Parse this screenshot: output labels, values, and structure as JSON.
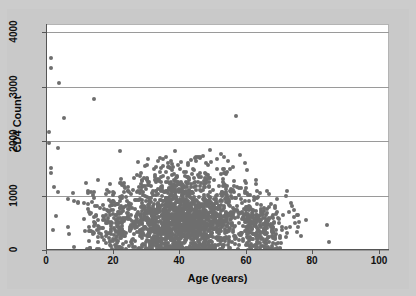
{
  "figure": {
    "background_color": "#c9c9c9",
    "plot_background_color": "#ffffff",
    "point_color": "#6e6e6e",
    "gridline_color": "#9a9a9a",
    "axis_color": "#555555"
  },
  "axes": {
    "x_title": "Age (years)",
    "y_title": "CD4 Count",
    "x_ticks": [
      "0",
      "20",
      "40",
      "60",
      "80",
      "100"
    ],
    "y_ticks": [
      "0",
      "1000",
      "2000",
      "3000",
      "4000"
    ]
  },
  "chart_data": {
    "type": "scatter",
    "title": "",
    "xlabel": "Age (years)",
    "ylabel": "CD4 Count",
    "xlim": [
      0,
      103
    ],
    "ylim": [
      0,
      4150
    ],
    "xticks": [
      0,
      20,
      40,
      60,
      80,
      100
    ],
    "yticks": [
      0,
      1000,
      2000,
      3000,
      4000
    ],
    "grid": "horizontal",
    "legend": "none",
    "marker": "circle",
    "marker_color": "#6e6e6e",
    "marker_size": 4,
    "points": [
      [
        1.5,
        3520
      ],
      [
        1.5,
        3350
      ],
      [
        4.0,
        3060
      ],
      [
        14.5,
        2780
      ],
      [
        1.0,
        2170
      ],
      [
        5.5,
        2420
      ],
      [
        1.0,
        1960
      ],
      [
        3.5,
        1880
      ],
      [
        1.5,
        1500
      ],
      [
        1.5,
        1420
      ],
      [
        2.5,
        1160
      ],
      [
        3.5,
        1060
      ],
      [
        8.0,
        1050
      ],
      [
        12.5,
        1080
      ],
      [
        13.5,
        1070
      ],
      [
        6.5,
        930
      ],
      [
        8.5,
        900
      ],
      [
        9.5,
        880
      ],
      [
        11.5,
        860
      ],
      [
        12.5,
        840
      ],
      [
        12.5,
        760
      ],
      [
        13.0,
        700
      ],
      [
        3.0,
        620
      ],
      [
        6.5,
        430
      ],
      [
        2.0,
        370
      ],
      [
        7.0,
        300
      ],
      [
        8.5,
        60
      ],
      [
        13.0,
        170
      ],
      [
        14.0,
        300
      ],
      [
        14.5,
        520
      ],
      [
        15.5,
        560
      ],
      [
        16.0,
        430
      ],
      [
        16.5,
        300
      ],
      [
        17.0,
        620
      ],
      [
        17.5,
        760
      ],
      [
        18.0,
        260
      ],
      [
        18.5,
        540
      ],
      [
        19.0,
        700
      ],
      [
        19.5,
        390
      ],
      [
        20.0,
        170
      ],
      [
        20.5,
        880
      ],
      [
        21.0,
        640
      ],
      [
        21.5,
        420
      ],
      [
        22.0,
        300
      ],
      [
        22.5,
        960
      ],
      [
        23.0,
        720
      ],
      [
        23.5,
        540
      ],
      [
        24.0,
        310
      ],
      [
        24.5,
        1150
      ],
      [
        25.0,
        830
      ],
      [
        25.5,
        650
      ],
      [
        26.0,
        470
      ],
      [
        26.5,
        1320
      ],
      [
        27.0,
        910
      ],
      [
        27.5,
        700
      ],
      [
        28.0,
        520
      ],
      [
        28.5,
        1420
      ],
      [
        29.0,
        1010
      ],
      [
        29.5,
        780
      ],
      [
        30.0,
        560
      ],
      [
        30.5,
        1250
      ],
      [
        31.0,
        950
      ],
      [
        31.5,
        720
      ],
      [
        32.0,
        480
      ],
      [
        32.5,
        1480
      ],
      [
        33.0,
        1080
      ],
      [
        33.5,
        820
      ],
      [
        34.0,
        600
      ],
      [
        34.5,
        1160
      ],
      [
        35.0,
        900
      ],
      [
        35.5,
        680
      ],
      [
        36.0,
        440
      ],
      [
        36.5,
        1530
      ],
      [
        37.0,
        1120
      ],
      [
        37.5,
        860
      ],
      [
        38.0,
        620
      ],
      [
        38.5,
        1280
      ],
      [
        39.0,
        980
      ],
      [
        39.5,
        740
      ],
      [
        40.0,
        500
      ],
      [
        40.5,
        1620
      ],
      [
        41.0,
        1190
      ],
      [
        41.5,
        900
      ],
      [
        42.0,
        660
      ],
      [
        42.5,
        1340
      ],
      [
        43.0,
        1020
      ],
      [
        43.5,
        780
      ],
      [
        44.0,
        540
      ],
      [
        44.5,
        1460
      ],
      [
        45.0,
        1100
      ],
      [
        45.5,
        840
      ],
      [
        46.0,
        580
      ],
      [
        46.5,
        1230
      ],
      [
        47.0,
        940
      ],
      [
        47.5,
        710
      ],
      [
        48.0,
        470
      ],
      [
        48.5,
        1560
      ],
      [
        49.0,
        1150
      ],
      [
        49.5,
        870
      ],
      [
        50.0,
        630
      ],
      [
        50.5,
        1290
      ],
      [
        51.0,
        990
      ],
      [
        51.5,
        750
      ],
      [
        52.0,
        510
      ],
      [
        52.5,
        1390
      ],
      [
        53.0,
        1060
      ],
      [
        53.5,
        800
      ],
      [
        54.0,
        560
      ],
      [
        54.5,
        1180
      ],
      [
        55.0,
        910
      ],
      [
        55.5,
        690
      ],
      [
        56.0,
        450
      ],
      [
        56.5,
        1270
      ],
      [
        57.0,
        960
      ],
      [
        57.5,
        730
      ],
      [
        58.0,
        490
      ],
      [
        58.5,
        1130
      ],
      [
        59.0,
        870
      ],
      [
        59.5,
        650
      ],
      [
        60.0,
        420
      ],
      [
        60.5,
        1040
      ],
      [
        61.0,
        800
      ],
      [
        61.5,
        600
      ],
      [
        62.0,
        380
      ],
      [
        62.5,
        920
      ],
      [
        63.0,
        710
      ],
      [
        63.5,
        530
      ],
      [
        64.0,
        340
      ],
      [
        64.5,
        830
      ],
      [
        65.0,
        640
      ],
      [
        65.5,
        470
      ],
      [
        66.0,
        300
      ],
      [
        66.5,
        760
      ],
      [
        67.0,
        580
      ],
      [
        67.5,
        420
      ],
      [
        68.0,
        260
      ],
      [
        69.0,
        660
      ],
      [
        70.0,
        500
      ],
      [
        71.0,
        370
      ],
      [
        72.0,
        240
      ],
      [
        72.5,
        1090
      ],
      [
        73.5,
        860
      ],
      [
        74.5,
        600
      ],
      [
        75.5,
        330
      ],
      [
        76.5,
        250
      ],
      [
        78.0,
        560
      ],
      [
        84.5,
        450
      ],
      [
        85.0,
        150
      ],
      [
        57.0,
        2460
      ],
      [
        52.5,
        1760
      ],
      [
        45.5,
        1700
      ],
      [
        43.5,
        1660
      ],
      [
        30.5,
        1680
      ],
      [
        33.5,
        1640
      ],
      [
        36.5,
        1590
      ],
      [
        39.5,
        1570
      ]
    ]
  }
}
